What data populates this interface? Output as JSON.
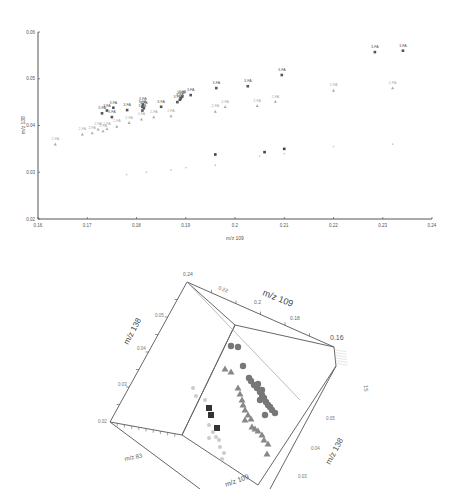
{
  "chart_data": [
    {
      "type": "scatter",
      "title": "",
      "xlabel": "m/z 109",
      "ylabel": "m/z 138",
      "xlim": [
        0.16,
        0.24
      ],
      "ylim": [
        0.02,
        0.06
      ],
      "x_ticks": [
        "0.16",
        "0.17",
        "0.18",
        "0.19",
        "0.2",
        "0.21",
        "0.22",
        "0.23",
        "0.24"
      ],
      "y_ticks": [
        "0.02",
        "0.03",
        "0.04",
        "0.05",
        "0.06"
      ],
      "grid": false,
      "legend": "none (points labeled inline)",
      "series": [
        {
          "name": "3-FA",
          "color": "#555555",
          "marker": "square",
          "label": "3-FA",
          "points": [
            [
              0.2284,
              0.0557
            ],
            [
              0.2341,
              0.056
            ],
            [
              0.2095,
              0.0508
            ],
            [
              0.2026,
              0.0484
            ],
            [
              0.1962,
              0.048
            ],
            [
              0.1893,
              0.0462
            ],
            [
              0.189,
              0.0458
            ],
            [
              0.1888,
              0.0455
            ],
            [
              0.1883,
              0.045
            ],
            [
              0.191,
              0.0465
            ],
            [
              0.1813,
              0.0445
            ],
            [
              0.1812,
              0.044
            ],
            [
              0.1815,
              0.0437
            ],
            [
              0.185,
              0.044
            ],
            [
              0.1812,
              0.0432
            ],
            [
              0.1753,
              0.0438
            ],
            [
              0.174,
              0.0432
            ],
            [
              0.173,
              0.0426
            ],
            [
              0.175,
              0.0418
            ],
            [
              0.1781,
              0.0433
            ]
          ]
        },
        {
          "name": "2-FA",
          "color": "#aaaaaa",
          "marker": "triangle",
          "label": "2-FA",
          "points": [
            [
              0.232,
              0.048
            ],
            [
              0.22,
              0.0475
            ],
            [
              0.2082,
              0.0451
            ],
            [
              0.2045,
              0.0442
            ],
            [
              0.198,
              0.044
            ],
            [
              0.196,
              0.043
            ],
            [
              0.187,
              0.042
            ],
            [
              0.1835,
              0.0418
            ],
            [
              0.181,
              0.0413
            ],
            [
              0.1785,
              0.0406
            ],
            [
              0.176,
              0.0398
            ],
            [
              0.174,
              0.0393
            ],
            [
              0.1722,
              0.0392
            ],
            [
              0.171,
              0.0384
            ],
            [
              0.169,
              0.0381
            ],
            [
              0.1732,
              0.0388
            ],
            [
              0.1635,
              0.036
            ]
          ]
        },
        {
          "name": "4-FA",
          "color": "#cccccc",
          "marker": "dot",
          "label": "",
          "points": [
            [
              0.21,
              0.034
            ],
            [
              0.205,
              0.0335
            ],
            [
              0.196,
              0.0315
            ],
            [
              0.19,
              0.031
            ],
            [
              0.187,
              0.0305
            ],
            [
              0.182,
              0.03
            ],
            [
              0.178,
              0.0295
            ],
            [
              0.22,
              0.0355
            ],
            [
              0.232,
              0.036
            ]
          ]
        },
        {
          "name": "dark-low",
          "color": "#444444",
          "marker": "square",
          "label": "",
          "points": [
            [
              0.196,
              0.0338
            ],
            [
              0.206,
              0.0343
            ],
            [
              0.21,
              0.035
            ]
          ]
        }
      ]
    },
    {
      "type": "scatter3d",
      "title": "",
      "axes": {
        "x": {
          "label": "m/z 109",
          "ticks": [
            "0.24",
            "0.22",
            "0.2",
            "0.18",
            "0.16"
          ]
        },
        "y": {
          "label": "m/z 138",
          "ticks": [
            "0.05",
            "0.04",
            "0.03",
            "0.02"
          ]
        },
        "z": {
          "label": "m/z 83",
          "ticks": []
        }
      },
      "series": [
        {
          "name": "circles",
          "color": "#777777",
          "marker": "circle"
        },
        {
          "name": "triangles",
          "color": "#888888",
          "marker": "triangle"
        },
        {
          "name": "squares",
          "color": "#333333",
          "marker": "square"
        },
        {
          "name": "light-dots",
          "color": "#cccccc",
          "marker": "circle"
        }
      ]
    }
  ],
  "scatter": {
    "xlabel": "m/z 109",
    "ylabel": "m/z 138",
    "x_ticks": [
      "0.16",
      "0.17",
      "0.18",
      "0.19",
      "0.2",
      "0.21",
      "0.22",
      "0.23",
      "0.24"
    ],
    "y_ticks": [
      "0.02",
      "0.03",
      "0.04",
      "0.05",
      "0.06"
    ]
  },
  "plot3d": {
    "x_label": "m/z 109",
    "y_label": "m/z 138",
    "z_label": "m/z 83",
    "y2_label": "m/z 138",
    "x_ticks": [
      "0.24",
      "0.22",
      "0.2",
      "0.18",
      "0.16"
    ],
    "y_ticks": [
      "0.05",
      "0.04",
      "0.03",
      "0.02"
    ],
    "x2_ticks": [
      "0.2",
      "0.22"
    ],
    "y2_ticks": [
      "0.05",
      "0.04",
      "0.03"
    ],
    "z_tick_label": "15"
  }
}
